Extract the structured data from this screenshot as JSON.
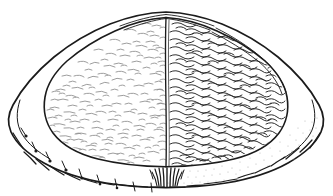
{
  "figure": {
    "view": "dorsal-external",
    "caption": "",
    "background_color": "#ffffff",
    "ink_color": "#1b1b1b",
    "light_texture_color": "#8b8b8b",
    "dark_texture_color": "#2e2e2e",
    "rim_stipple_color": "#a9a9a9"
  },
  "canvas": {
    "width": 333,
    "height": 196
  },
  "anatomy": {
    "outer_margin": {
      "label": "outer shell margin",
      "stroke_width": 1.7,
      "apex_x": 166,
      "apex_y": 12,
      "left_extent_x": 9,
      "right_extent_x": 324,
      "bottom_y": 187
    },
    "inner_disc": {
      "label": "central disc",
      "stroke_width": 1.6,
      "apex_x": 166,
      "apex_y": 17,
      "left_extent_x": 44,
      "right_extent_x": 289,
      "bottom_y": 166
    },
    "median_line": {
      "label": "median division line",
      "x_top": 166,
      "x_bottom": 166,
      "y_top": 17,
      "y_bottom": 167,
      "stroke_width": 1.3
    },
    "hinge_structure": {
      "label": "hinge teeth tuft",
      "center_x": 166,
      "top_y": 168,
      "bottom_y": 188,
      "prong_count": 7
    },
    "crenulations": {
      "label": "scalloped ventral margin",
      "lobe_count": 22,
      "tick_count": 9,
      "tick_side": "left"
    }
  },
  "texture_fields": [
    {
      "name": "left-field",
      "label": "left half sparse dash texture",
      "density": "sparse",
      "stroke_color": "#8b8b8b",
      "mark_count": 420,
      "mark_style": "short-dash"
    },
    {
      "name": "right-field",
      "label": "right half dense wavy texture",
      "density": "dense",
      "stroke_color": "#2e2e2e",
      "mark_count": 950,
      "mark_style": "wavy-squiggle"
    }
  ],
  "labels": {
    "figure_number": "",
    "specimen_name": "",
    "scale_bar": ""
  }
}
